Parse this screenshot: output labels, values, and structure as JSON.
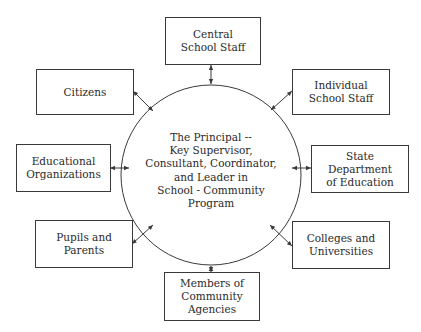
{
  "diagram": {
    "center": {
      "label": "The Principal --\nKey Supervisor,\nConsultant, Coordinator,\nand Leader in\nSchool - Community\nProgram"
    },
    "nodes": [
      {
        "id": "central-school-staff",
        "label": "Central\nSchool Staff"
      },
      {
        "id": "citizens",
        "label": "Citizens"
      },
      {
        "id": "individual-school-staff",
        "label": "Individual\nSchool Staff"
      },
      {
        "id": "educational-organizations",
        "label": "Educational\nOrganizations"
      },
      {
        "id": "state-department-of-education",
        "label": "State\nDepartment\nof Education"
      },
      {
        "id": "pupils-and-parents",
        "label": "Pupils and\nParents"
      },
      {
        "id": "colleges-and-universities",
        "label": "Colleges and\nUniversities"
      },
      {
        "id": "members-of-community-agencies",
        "label": "Members of\nCommunity\nAgencies"
      }
    ],
    "connections": [
      {
        "from": "center",
        "to": "central-school-staff",
        "arrows": "both"
      },
      {
        "from": "center",
        "to": "citizens",
        "arrows": "both"
      },
      {
        "from": "center",
        "to": "individual-school-staff",
        "arrows": "both"
      },
      {
        "from": "center",
        "to": "educational-organizations",
        "arrows": "both"
      },
      {
        "from": "center",
        "to": "state-department-of-education",
        "arrows": "both"
      },
      {
        "from": "center",
        "to": "pupils-and-parents",
        "arrows": "both"
      },
      {
        "from": "center",
        "to": "colleges-and-universities",
        "arrows": "both"
      },
      {
        "from": "center",
        "to": "members-of-community-agencies",
        "arrows": "both"
      }
    ],
    "colors": {
      "line": "#3a3a3a",
      "background": "#ffffff",
      "text": "#2a2a2a"
    }
  }
}
